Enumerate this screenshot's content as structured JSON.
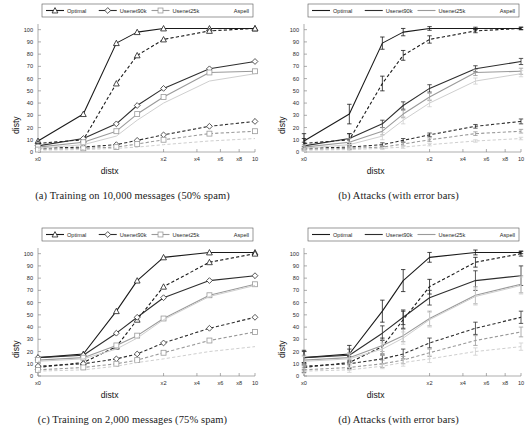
{
  "figure": {
    "panel_count": 4
  },
  "axes": {
    "xlabel": "distx",
    "ylabel": "disty",
    "yticks": [
      "0",
      "10",
      "20",
      "30",
      "40",
      "50",
      "60",
      "70",
      "80",
      "90",
      "100"
    ],
    "xticks": [
      "x0",
      "x2",
      "x4",
      "x6",
      "x8",
      "10"
    ],
    "ylim": [
      0,
      103
    ],
    "xlim": [
      0,
      10
    ]
  },
  "legend": {
    "entries": [
      {
        "label": "Optimal",
        "marker": "triangle",
        "color": "#1a1a1a"
      },
      {
        "label": "Usenet90k",
        "marker": "diamond",
        "color": "#2e2e2e"
      },
      {
        "label": "Usenet25k",
        "marker": "square",
        "color": "#9a9a9a"
      },
      {
        "label": "Aspell",
        "marker": "none",
        "color": "#cfcfcf"
      }
    ]
  },
  "panels": [
    {
      "id": "a",
      "caption": "(a) Training on 10,000 messages (50% spam)",
      "markers": true,
      "errorbars": false
    },
    {
      "id": "b",
      "caption": "(b) Attacks (with error bars)",
      "markers": false,
      "errorbars": true
    },
    {
      "id": "c",
      "caption": "(c) Training on 2,000 messages (75% spam)",
      "markers": true,
      "errorbars": false
    },
    {
      "id": "d",
      "caption": "(d) Attacks (with error bars)",
      "markers": false,
      "errorbars": true
    }
  ],
  "chart_data": [
    {
      "type": "line",
      "panel": "a",
      "title": "(a) Training on 10,000 messages (50% spam)",
      "xlabel": "distx",
      "ylabel": "disty",
      "xticklabels": [
        "x0",
        "x2",
        "x4",
        "x6",
        "x8",
        "10"
      ],
      "xtickvalues": [
        0,
        2,
        4,
        6,
        8,
        10
      ],
      "yticklabels": [
        "0",
        "10",
        "20",
        "30",
        "40",
        "50",
        "60",
        "70",
        "80",
        "90",
        "100"
      ],
      "ylim": [
        0,
        103
      ],
      "xlim": [
        0,
        10
      ],
      "grid": false,
      "legend_position": "top",
      "x": [
        0,
        0.1,
        0.5,
        1,
        2,
        5,
        10
      ],
      "series": [
        {
          "name": "Optimal",
          "style": "solid",
          "marker": "triangle",
          "color": "#1a1a1a",
          "values": [
            9,
            31,
            89,
            98,
            101,
            101,
            101
          ]
        },
        {
          "name": "Optimal (dashed)",
          "style": "dashed",
          "marker": "triangle",
          "color": "#1a1a1a",
          "values": [
            7,
            10,
            56,
            79,
            92,
            99,
            101
          ]
        },
        {
          "name": "Usenet90k",
          "style": "solid",
          "marker": "diamond",
          "color": "#2e2e2e",
          "values": [
            5,
            11,
            23,
            38,
            52,
            68,
            74
          ]
        },
        {
          "name": "Usenet90k (dashed)",
          "style": "dashed",
          "marker": "diamond",
          "color": "#2e2e2e",
          "values": [
            3,
            4,
            6,
            9.5,
            14,
            21,
            25
          ]
        },
        {
          "name": "Usenet25k",
          "style": "solid",
          "marker": "square",
          "color": "#9a9a9a",
          "values": [
            4,
            8,
            17,
            31,
            45,
            65,
            66
          ]
        },
        {
          "name": "Usenet25k (dashed)",
          "style": "dashed",
          "marker": "square",
          "color": "#9a9a9a",
          "values": [
            2,
            3,
            4,
            6.5,
            10,
            15,
            17
          ]
        },
        {
          "name": "Aspell",
          "style": "solid",
          "marker": "none",
          "color": "#cfcfcf",
          "values": [
            3,
            6,
            13,
            26,
            40,
            58,
            64
          ]
        },
        {
          "name": "Aspell (dashed)",
          "style": "dashed",
          "marker": "none",
          "color": "#cfcfcf",
          "values": [
            1.5,
            2,
            3,
            4,
            6,
            9,
            11
          ]
        }
      ]
    },
    {
      "type": "line",
      "panel": "b",
      "title": "(b) Attacks (with error bars)",
      "xlabel": "distx",
      "ylabel": "disty",
      "xticklabels": [
        "x0",
        "x2",
        "x4",
        "x6",
        "x8",
        "10"
      ],
      "xtickvalues": [
        0,
        2,
        4,
        6,
        8,
        10
      ],
      "yticklabels": [
        "0",
        "10",
        "20",
        "30",
        "40",
        "50",
        "60",
        "70",
        "80",
        "90",
        "100"
      ],
      "ylim": [
        0,
        103
      ],
      "xlim": [
        0,
        10
      ],
      "grid": false,
      "legend_position": "top",
      "x": [
        0,
        0.1,
        0.5,
        1,
        2,
        5,
        10
      ],
      "series": [
        {
          "name": "Optimal",
          "style": "solid",
          "marker": "none",
          "color": "#1a1a1a",
          "values": [
            9,
            31,
            89,
            98,
            101,
            101,
            101
          ],
          "errors": [
            6,
            8,
            5,
            3,
            1.5,
            1,
            1
          ]
        },
        {
          "name": "Optimal (dashed)",
          "style": "dashed",
          "marker": "none",
          "color": "#1a1a1a",
          "values": [
            7,
            10,
            56,
            79,
            92,
            99,
            101
          ],
          "errors": [
            4,
            5,
            6,
            4,
            3,
            1.5,
            1
          ]
        },
        {
          "name": "Usenet90k",
          "style": "solid",
          "marker": "none",
          "color": "#2e2e2e",
          "values": [
            5,
            11,
            23,
            38,
            52,
            68,
            74
          ],
          "errors": [
            3,
            4,
            3,
            3,
            3,
            2.5,
            2.5
          ]
        },
        {
          "name": "Usenet90k (dashed)",
          "style": "dashed",
          "marker": "none",
          "color": "#2e2e2e",
          "values": [
            3,
            4,
            6,
            9.5,
            14,
            21,
            25
          ],
          "errors": [
            1.5,
            1.5,
            1.5,
            1.5,
            1.5,
            1.5,
            2
          ]
        },
        {
          "name": "Usenet25k",
          "style": "solid",
          "marker": "none",
          "color": "#9a9a9a",
          "values": [
            4,
            8,
            17,
            31,
            45,
            65,
            66
          ],
          "errors": [
            2,
            3,
            3,
            3,
            3,
            2.5,
            2.5
          ]
        },
        {
          "name": "Usenet25k (dashed)",
          "style": "dashed",
          "marker": "none",
          "color": "#9a9a9a",
          "values": [
            2,
            3,
            4,
            6.5,
            10,
            15,
            17
          ],
          "errors": [
            1,
            1,
            1,
            1.5,
            1.5,
            1.5,
            1.5
          ]
        },
        {
          "name": "Aspell",
          "style": "solid",
          "marker": "none",
          "color": "#cfcfcf",
          "values": [
            3,
            6,
            13,
            26,
            40,
            58,
            64
          ],
          "errors": [
            2,
            2,
            3,
            3,
            3,
            2.5,
            2.5
          ]
        },
        {
          "name": "Aspell (dashed)",
          "style": "dashed",
          "marker": "none",
          "color": "#cfcfcf",
          "values": [
            1.5,
            2,
            3,
            4,
            6,
            9,
            11
          ],
          "errors": [
            1,
            1,
            1,
            1,
            1,
            1,
            1
          ]
        }
      ]
    },
    {
      "type": "line",
      "panel": "c",
      "title": "(c) Training on 2,000 messages (75% spam)",
      "xlabel": "distx",
      "ylabel": "disty",
      "xticklabels": [
        "x0",
        "x2",
        "x4",
        "x6",
        "x8",
        "10"
      ],
      "xtickvalues": [
        0,
        2,
        4,
        6,
        8,
        10
      ],
      "yticklabels": [
        "0",
        "10",
        "20",
        "30",
        "40",
        "50",
        "60",
        "70",
        "80",
        "90",
        "100"
      ],
      "ylim": [
        0,
        103
      ],
      "xlim": [
        0,
        10
      ],
      "grid": false,
      "legend_position": "top",
      "x": [
        0,
        0.1,
        0.5,
        1,
        2,
        5,
        10
      ],
      "series": [
        {
          "name": "Optimal",
          "style": "solid",
          "marker": "triangle",
          "color": "#1a1a1a",
          "values": [
            15,
            18,
            53,
            78,
            97,
            101,
            101
          ]
        },
        {
          "name": "Optimal (dashed)",
          "style": "dashed",
          "marker": "triangle",
          "color": "#1a1a1a",
          "values": [
            7,
            11,
            24,
            46,
            73,
            93,
            100
          ]
        },
        {
          "name": "Usenet90k",
          "style": "solid",
          "marker": "diamond",
          "color": "#2e2e2e",
          "values": [
            15,
            17,
            35,
            48,
            64,
            78,
            82
          ]
        },
        {
          "name": "Usenet90k (dashed)",
          "style": "dashed",
          "marker": "diamond",
          "color": "#2e2e2e",
          "values": [
            8,
            10,
            14,
            18,
            27,
            39,
            48
          ]
        },
        {
          "name": "Usenet25k",
          "style": "solid",
          "marker": "square",
          "color": "#9a9a9a",
          "values": [
            13,
            15,
            25,
            33,
            47,
            66,
            75
          ]
        },
        {
          "name": "Usenet25k (dashed)",
          "style": "dashed",
          "marker": "square",
          "color": "#9a9a9a",
          "values": [
            5,
            7,
            10,
            13,
            19,
            29,
            36
          ]
        },
        {
          "name": "Aspell",
          "style": "solid",
          "marker": "none",
          "color": "#cfcfcf",
          "values": [
            12,
            14,
            22,
            31,
            46,
            65,
            74
          ]
        },
        {
          "name": "Aspell (dashed)",
          "style": "dashed",
          "marker": "none",
          "color": "#cfcfcf",
          "values": [
            4,
            5,
            8,
            11,
            14,
            20,
            24
          ]
        }
      ]
    },
    {
      "type": "line",
      "panel": "d",
      "title": "(d) Attacks (with error bars)",
      "xlabel": "distx",
      "ylabel": "disty",
      "xticklabels": [
        "x0",
        "x2",
        "x4",
        "x6",
        "x8",
        "10"
      ],
      "xtickvalues": [
        0,
        2,
        4,
        6,
        8,
        10
      ],
      "yticklabels": [
        "0",
        "10",
        "20",
        "30",
        "40",
        "50",
        "60",
        "70",
        "80",
        "90",
        "100"
      ],
      "ylim": [
        0,
        103
      ],
      "xlim": [
        0,
        10
      ],
      "grid": false,
      "legend_position": "top",
      "x": [
        0,
        0.1,
        0.5,
        1,
        2,
        5,
        10
      ],
      "series": [
        {
          "name": "Optimal",
          "style": "solid",
          "marker": "none",
          "color": "#1a1a1a",
          "values": [
            15,
            18,
            53,
            78,
            97,
            101,
            101
          ],
          "errors": [
            6,
            7,
            9,
            9,
            4,
            2,
            1
          ]
        },
        {
          "name": "Optimal (dashed)",
          "style": "dashed",
          "marker": "none",
          "color": "#1a1a1a",
          "values": [
            7,
            11,
            24,
            46,
            73,
            93,
            100
          ],
          "errors": [
            4,
            5,
            7,
            7,
            6,
            4,
            2
          ]
        },
        {
          "name": "Usenet90k",
          "style": "solid",
          "marker": "none",
          "color": "#2e2e2e",
          "values": [
            15,
            17,
            35,
            48,
            64,
            78,
            82
          ],
          "errors": [
            5,
            5,
            6,
            6,
            6,
            8,
            8
          ]
        },
        {
          "name": "Usenet90k (dashed)",
          "style": "dashed",
          "marker": "none",
          "color": "#2e2e2e",
          "values": [
            8,
            10,
            14,
            18,
            27,
            39,
            48
          ],
          "errors": [
            3,
            3,
            4,
            4,
            4,
            5,
            5
          ]
        },
        {
          "name": "Usenet25k",
          "style": "solid",
          "marker": "none",
          "color": "#9a9a9a",
          "values": [
            13,
            15,
            25,
            33,
            47,
            66,
            75
          ],
          "errors": [
            4,
            4,
            5,
            5,
            6,
            7,
            7
          ]
        },
        {
          "name": "Usenet25k (dashed)",
          "style": "dashed",
          "marker": "none",
          "color": "#9a9a9a",
          "values": [
            5,
            7,
            10,
            13,
            19,
            29,
            36
          ],
          "errors": [
            2,
            2,
            3,
            3,
            3,
            4,
            4
          ]
        },
        {
          "name": "Aspell",
          "style": "solid",
          "marker": "none",
          "color": "#cfcfcf",
          "values": [
            12,
            14,
            22,
            31,
            46,
            65,
            74
          ],
          "errors": [
            4,
            4,
            5,
            5,
            6,
            7,
            7
          ]
        },
        {
          "name": "Aspell (dashed)",
          "style": "dashed",
          "marker": "none",
          "color": "#cfcfcf",
          "values": [
            4,
            5,
            8,
            11,
            14,
            20,
            24
          ],
          "errors": [
            2,
            2,
            2,
            3,
            3,
            3,
            3
          ]
        }
      ]
    }
  ]
}
